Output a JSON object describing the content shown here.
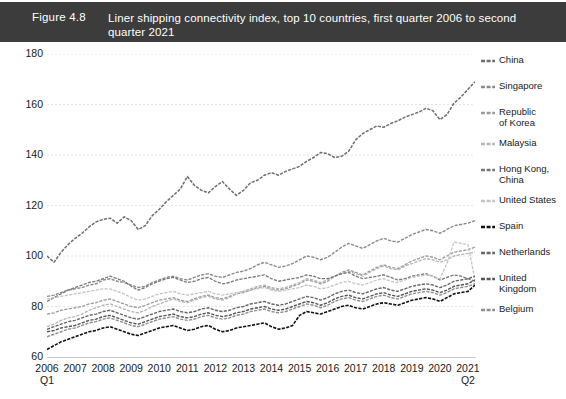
{
  "figure": {
    "number": "Figure 4.8",
    "title": "Liner shipping connectivity index, top 10 countries, first quarter 2006 to second quarter 2021"
  },
  "chart_data": {
    "type": "line",
    "title": "Liner shipping connectivity index, top 10 countries, first quarter 2006 to second quarter 2021",
    "xlabel": "",
    "ylabel": "",
    "ylim": [
      60,
      180
    ],
    "yticks": [
      60,
      80,
      100,
      120,
      140,
      160,
      180
    ],
    "grid": true,
    "legend_position": "right",
    "x_axis_first_label": "2006",
    "x_axis_first_sublabel": "Q1",
    "x_axis_last_label": "2021",
    "x_axis_last_sublabel": "Q2",
    "xtick_labels": [
      "2006",
      "2007",
      "2008",
      "2009",
      "2010",
      "2011",
      "2012",
      "2013",
      "2014",
      "2015",
      "2016",
      "2017",
      "2018",
      "2019",
      "2020",
      "2021"
    ],
    "x_start_quarter": "2006 Q1",
    "x_end_quarter": "2021 Q2",
    "n_points": 62,
    "series": [
      {
        "name": "China",
        "color": "#6e6e6e",
        "width": 1.5,
        "values": [
          100.0,
          97.5,
          101.5,
          104.5,
          107.0,
          109.0,
          111.5,
          113.5,
          114.5,
          115.0,
          113.0,
          115.5,
          114.0,
          110.5,
          112.0,
          116.0,
          118.5,
          121.5,
          124.0,
          126.5,
          131.5,
          128.0,
          126.0,
          125.0,
          127.5,
          129.5,
          126.5,
          124.0,
          126.0,
          129.0,
          130.0,
          132.0,
          133.0,
          132.0,
          133.5,
          134.5,
          135.5,
          137.5,
          139.0,
          141.0,
          140.5,
          139.0,
          139.5,
          141.5,
          146.0,
          148.5,
          150.0,
          151.5,
          151.0,
          152.5,
          153.5,
          155.0,
          156.0,
          157.0,
          158.5,
          157.5,
          154.0,
          156.0,
          160.5,
          163.0,
          166.0,
          169.0
        ]
      },
      {
        "name": "Singapore",
        "color": "#8a8a8a",
        "width": 1.4,
        "values": [
          84.0,
          84.5,
          85.5,
          86.5,
          87.0,
          87.5,
          88.5,
          89.0,
          90.5,
          91.0,
          90.0,
          89.5,
          88.5,
          87.5,
          88.0,
          89.5,
          90.5,
          91.5,
          92.0,
          91.0,
          90.5,
          91.5,
          92.5,
          93.0,
          92.0,
          91.5,
          92.5,
          93.5,
          94.0,
          95.0,
          96.5,
          97.5,
          96.5,
          95.5,
          96.0,
          97.0,
          98.5,
          100.0,
          99.5,
          98.5,
          99.5,
          101.5,
          103.5,
          105.0,
          104.0,
          103.0,
          104.5,
          106.0,
          107.0,
          106.0,
          105.5,
          107.0,
          108.5,
          109.5,
          110.5,
          110.0,
          109.0,
          110.5,
          112.0,
          112.5,
          113.0,
          114.0
        ]
      },
      {
        "name": "Republic of Korea",
        "color": "#9a9a9a",
        "width": 1.3,
        "values": [
          77.0,
          77.5,
          78.5,
          79.0,
          79.5,
          80.0,
          81.0,
          81.5,
          82.5,
          83.0,
          82.0,
          81.0,
          80.0,
          79.5,
          80.5,
          81.5,
          82.5,
          83.0,
          83.5,
          82.5,
          82.0,
          83.0,
          84.0,
          84.5,
          83.5,
          83.0,
          84.0,
          85.0,
          85.5,
          86.5,
          87.5,
          88.0,
          87.0,
          86.5,
          87.0,
          88.0,
          89.0,
          90.5,
          90.0,
          89.0,
          90.0,
          92.0,
          93.5,
          94.5,
          93.5,
          92.5,
          94.0,
          95.5,
          96.5,
          95.5,
          95.0,
          96.5,
          98.0,
          99.0,
          100.0,
          99.5,
          98.5,
          100.0,
          101.5,
          102.0,
          102.5,
          103.5
        ]
      },
      {
        "name": "Malaysia",
        "color": "#b5b5b5",
        "width": 1.3,
        "values": [
          72.0,
          73.0,
          74.5,
          75.5,
          76.0,
          77.0,
          78.5,
          79.5,
          80.5,
          81.0,
          80.0,
          79.0,
          78.0,
          77.5,
          78.5,
          80.0,
          81.0,
          82.0,
          83.0,
          82.0,
          81.5,
          82.5,
          83.5,
          84.0,
          83.0,
          82.5,
          83.5,
          85.0,
          86.0,
          87.0,
          88.0,
          88.5,
          87.5,
          87.0,
          87.5,
          88.5,
          89.5,
          91.0,
          90.5,
          89.5,
          90.5,
          92.0,
          93.0,
          94.0,
          93.0,
          92.0,
          93.5,
          95.0,
          96.0,
          95.0,
          94.5,
          96.0,
          97.0,
          98.0,
          99.0,
          98.5,
          97.5,
          98.5,
          100.0,
          100.5,
          101.0,
          101.5
        ]
      },
      {
        "name": "Hong Kong, China",
        "color": "#777777",
        "width": 1.3,
        "values": [
          82.0,
          83.5,
          85.0,
          86.5,
          87.5,
          88.5,
          89.5,
          90.0,
          91.0,
          92.0,
          91.0,
          90.0,
          88.0,
          86.5,
          87.5,
          89.0,
          90.0,
          91.0,
          91.5,
          90.5,
          89.5,
          90.0,
          91.0,
          91.5,
          90.0,
          89.0,
          89.5,
          90.5,
          91.0,
          91.5,
          92.0,
          92.5,
          91.0,
          90.0,
          90.5,
          91.0,
          91.5,
          92.5,
          92.0,
          91.0,
          91.0,
          92.0,
          93.0,
          93.5,
          92.0,
          91.0,
          91.5,
          92.0,
          92.5,
          91.5,
          90.5,
          91.0,
          92.0,
          92.5,
          93.0,
          92.0,
          90.5,
          91.5,
          92.5,
          92.0,
          91.0,
          90.0
        ]
      },
      {
        "name": "United States",
        "color": "#c4c4c4",
        "width": 1.3,
        "values": [
          83.0,
          83.5,
          84.0,
          84.5,
          85.0,
          85.5,
          86.0,
          86.5,
          87.0,
          87.0,
          86.0,
          85.0,
          83.5,
          82.5,
          83.0,
          84.0,
          85.0,
          85.5,
          86.0,
          85.0,
          84.5,
          85.0,
          85.5,
          86.0,
          85.0,
          84.5,
          85.0,
          85.5,
          86.0,
          86.5,
          87.0,
          87.5,
          86.5,
          86.0,
          86.5,
          87.0,
          87.5,
          88.5,
          88.0,
          87.0,
          87.5,
          88.5,
          89.5,
          90.0,
          89.0,
          88.5,
          89.5,
          90.5,
          91.0,
          90.0,
          89.5,
          90.5,
          91.5,
          92.0,
          92.5,
          92.0,
          91.0,
          97.0,
          105.5,
          105.0,
          104.5,
          90.5
        ]
      },
      {
        "name": "Spain",
        "color": "#111111",
        "width": 1.6,
        "values": [
          63.0,
          64.5,
          66.0,
          67.0,
          68.0,
          69.0,
          70.0,
          70.5,
          71.5,
          72.0,
          71.0,
          70.0,
          69.0,
          68.5,
          69.5,
          70.5,
          71.5,
          72.0,
          72.5,
          71.5,
          70.5,
          71.0,
          72.0,
          72.5,
          71.0,
          70.0,
          70.5,
          71.5,
          72.0,
          72.5,
          73.0,
          73.5,
          72.0,
          71.0,
          71.5,
          72.5,
          76.5,
          78.0,
          77.5,
          77.0,
          78.0,
          79.0,
          80.0,
          80.5,
          79.5,
          79.0,
          80.0,
          81.0,
          81.5,
          81.0,
          80.5,
          81.5,
          82.5,
          83.0,
          83.5,
          83.0,
          82.0,
          83.5,
          85.0,
          85.5,
          86.0,
          88.5
        ]
      },
      {
        "name": "Netherlands",
        "color": "#666666",
        "width": 1.4,
        "values": [
          71.0,
          72.0,
          73.0,
          74.0,
          74.5,
          75.5,
          76.5,
          77.0,
          78.0,
          78.5,
          77.5,
          76.5,
          75.5,
          75.0,
          76.0,
          77.0,
          78.0,
          78.5,
          79.0,
          78.0,
          77.5,
          78.0,
          79.0,
          79.5,
          78.5,
          78.0,
          78.5,
          79.5,
          80.0,
          81.0,
          81.5,
          82.0,
          81.0,
          80.5,
          81.0,
          82.0,
          83.0,
          84.0,
          83.5,
          82.5,
          83.5,
          85.0,
          86.0,
          86.5,
          85.5,
          85.0,
          86.0,
          87.0,
          87.5,
          86.5,
          86.0,
          87.0,
          88.0,
          88.5,
          89.0,
          88.5,
          87.5,
          88.5,
          90.0,
          90.5,
          91.0,
          92.0
        ]
      },
      {
        "name": "United Kingdom",
        "color": "#555555",
        "width": 1.4,
        "values": [
          70.0,
          70.5,
          71.5,
          72.0,
          72.5,
          73.5,
          74.5,
          75.0,
          76.0,
          76.5,
          75.5,
          74.5,
          73.5,
          73.0,
          74.0,
          75.0,
          76.0,
          76.5,
          77.0,
          76.0,
          75.5,
          76.0,
          77.0,
          77.5,
          76.5,
          76.0,
          76.5,
          77.5,
          78.0,
          79.0,
          79.5,
          80.0,
          79.0,
          78.5,
          79.0,
          80.0,
          81.0,
          82.0,
          81.5,
          80.5,
          81.5,
          83.0,
          84.0,
          84.5,
          83.5,
          83.0,
          84.0,
          85.0,
          85.5,
          84.5,
          84.0,
          85.0,
          86.0,
          86.5,
          87.0,
          86.5,
          85.5,
          86.5,
          88.0,
          88.5,
          89.0,
          90.5
        ]
      },
      {
        "name": "Belgium",
        "color": "#8f8f8f",
        "width": 1.4,
        "values": [
          68.0,
          69.0,
          70.0,
          71.0,
          71.5,
          72.5,
          73.5,
          74.0,
          75.0,
          75.5,
          74.5,
          73.5,
          72.5,
          72.0,
          73.0,
          74.0,
          75.0,
          75.5,
          76.0,
          75.0,
          74.5,
          75.0,
          76.0,
          76.5,
          75.5,
          75.0,
          75.5,
          76.5,
          77.0,
          78.0,
          78.5,
          79.0,
          78.0,
          77.5,
          78.0,
          79.0,
          80.0,
          81.0,
          80.5,
          79.5,
          80.5,
          82.0,
          83.0,
          83.5,
          82.5,
          82.0,
          83.0,
          84.0,
          84.5,
          83.5,
          83.0,
          84.0,
          85.0,
          85.5,
          86.0,
          85.5,
          84.5,
          85.5,
          87.0,
          87.5,
          88.0,
          89.0
        ]
      }
    ]
  },
  "legend": {
    "items": [
      {
        "label": "China",
        "color": "#6e6e6e"
      },
      {
        "label": "Singapore",
        "color": "#8a8a8a"
      },
      {
        "label": "Republic\nof Korea",
        "color": "#9a9a9a"
      },
      {
        "label": "Malaysia",
        "color": "#b5b5b5"
      },
      {
        "label": "Hong Kong,\nChina",
        "color": "#777777"
      },
      {
        "label": "United States",
        "color": "#c4c4c4"
      },
      {
        "label": "Spain",
        "color": "#111111"
      },
      {
        "label": "Netherlands",
        "color": "#666666"
      },
      {
        "label": "United\nKingdom",
        "color": "#555555"
      },
      {
        "label": "Belgium",
        "color": "#8f8f8f"
      }
    ]
  }
}
